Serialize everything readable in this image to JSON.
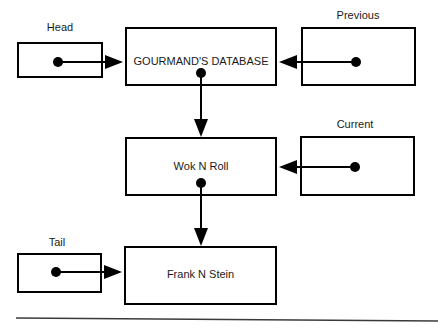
{
  "diagram": {
    "background_color": "#ffffff",
    "stroke_color": "#000000",
    "text_color": "#1a1a1a",
    "rule_color": "#3a3a3a",
    "pointer_boxes": [
      {
        "id": "head",
        "caption": "Head",
        "caption_x": 60,
        "caption_y": 22,
        "box": {
          "x": 17,
          "y": 42,
          "w": 85,
          "h": 35
        },
        "dot": {
          "x": 58,
          "y": 62,
          "r": 5
        },
        "arrow_to_x": 123,
        "arrow_dir": "right"
      },
      {
        "id": "previous",
        "caption": "Previous",
        "caption_x": 358,
        "caption_y": 10,
        "box": {
          "x": 301,
          "y": 27,
          "w": 115,
          "h": 59
        },
        "dot": {
          "x": 356,
          "y": 62,
          "r": 5
        },
        "arrow_to_x": 279,
        "arrow_dir": "left"
      },
      {
        "id": "current",
        "caption": "Current",
        "caption_x": 355,
        "caption_y": 119,
        "box": {
          "x": 300,
          "y": 136,
          "w": 115,
          "h": 60
        },
        "dot": {
          "x": 355,
          "y": 167,
          "r": 5
        },
        "arrow_to_x": 279,
        "arrow_dir": "left"
      },
      {
        "id": "tail",
        "caption": "Tail",
        "caption_x": 57,
        "caption_y": 237,
        "box": {
          "x": 17,
          "y": 253,
          "w": 84,
          "h": 39
        },
        "dot": {
          "x": 56,
          "y": 272,
          "r": 5
        },
        "arrow_to_x": 122,
        "arrow_dir": "right"
      }
    ],
    "node_boxes": [
      {
        "id": "gourmands-database",
        "label": "GOURMAND'S DATABASE",
        "box": {
          "x": 125,
          "y": 27,
          "w": 152,
          "h": 59
        },
        "label_cx": 201,
        "label_cy": 62
      },
      {
        "id": "wok-n-roll",
        "label": "Wok N Roll",
        "box": {
          "x": 125,
          "y": 137,
          "w": 152,
          "h": 59
        },
        "label_cx": 201,
        "label_cy": 167
      },
      {
        "id": "frank-n-stein",
        "label": "Frank N Stein",
        "box": {
          "x": 124,
          "y": 246,
          "w": 153,
          "h": 59
        },
        "label_cx": 201,
        "label_cy": 275
      }
    ],
    "vertical_links": [
      {
        "id": "db-to-wok",
        "from_node": "gourmands-database",
        "to_node": "wok-n-roll",
        "x": 201,
        "dot_y": 73,
        "arrow_tip_y": 137
      },
      {
        "id": "wok-to-frank",
        "from_node": "wok-n-roll",
        "to_node": "frank-n-stein",
        "x": 201,
        "dot_y": 183,
        "arrow_tip_y": 246
      }
    ],
    "baseline_rule": {
      "x1": 16,
      "y1": 318,
      "x2": 438,
      "y2": 321
    }
  }
}
